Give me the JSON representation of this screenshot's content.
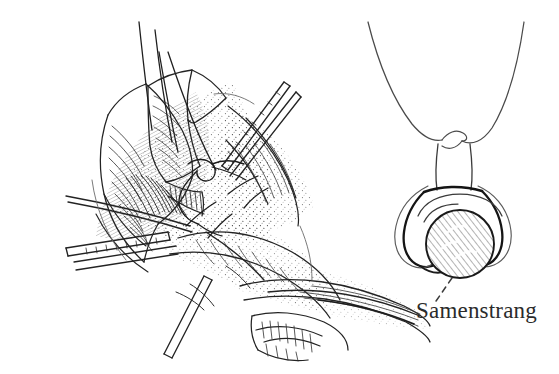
{
  "figure": {
    "kind": "anatomical-line-drawing",
    "background_color": "#ffffff",
    "ink_color": "#232323",
    "mid_ink_color": "#4a4a4a",
    "light_ink_color": "#777777",
    "panels": [
      {
        "name": "operative-field",
        "caption": "",
        "description": "Surgical operative field line drawing with retractor blades, hatched fascia and exposed cord structures"
      },
      {
        "name": "cross-section-schematic",
        "caption": "",
        "description": "Schematic cross-section with two suture threads crossing above a shaded round structure"
      }
    ],
    "labels": [
      {
        "id": "samenstrang",
        "text": "Samenstrang",
        "leader": "dashed",
        "points_to": "shaded-round-structure"
      }
    ]
  }
}
